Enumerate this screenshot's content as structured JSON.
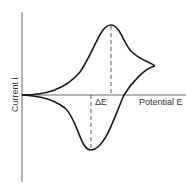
{
  "diagram": {
    "x_axis_label": "Potential E",
    "y_axis_label": "Current i",
    "delta_label": "ΔE",
    "colors": {
      "curve": "#1a1a1a",
      "axis": "#555555",
      "dashed": "#333333",
      "text": "#333333"
    }
  }
}
